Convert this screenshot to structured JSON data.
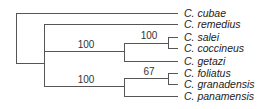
{
  "diagram": {
    "type": "phylogenetic-tree",
    "taxa": [
      {
        "name": "C. cubae",
        "y": 13
      },
      {
        "name": "C. remedius",
        "y": 24
      },
      {
        "name": "C. salei",
        "y": 37
      },
      {
        "name": "C. coccineus",
        "y": 48
      },
      {
        "name": "C. getazi",
        "y": 61
      },
      {
        "name": "C. foliatus",
        "y": 73
      },
      {
        "name": "C. granadensis",
        "y": 84
      },
      {
        "name": "C. panamensis",
        "y": 96
      }
    ],
    "support_values": [
      {
        "value": "100",
        "clade": "salei+coccineus+getazi"
      },
      {
        "value": "100",
        "clade": "salei+coccineus"
      },
      {
        "value": "100",
        "clade": "foliatus+granadensis+panamensis"
      },
      {
        "value": "67",
        "clade": "foliatus+granadensis"
      }
    ],
    "branch_color": "#555555"
  }
}
